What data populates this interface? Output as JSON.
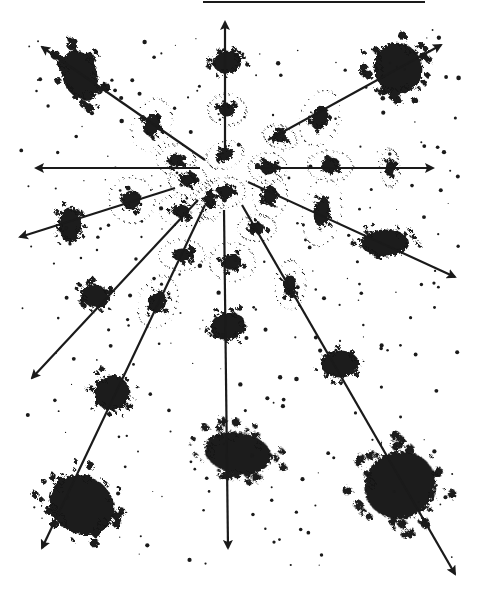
{
  "figure": {
    "ink_color": "#1a1a1a",
    "background_color": "#ffffff",
    "top_rule": {
      "x1": 203,
      "y1": 2,
      "x2": 425,
      "y2": 2
    },
    "center": {
      "x": 222,
      "y": 170
    },
    "arrows": [
      {
        "id": "up",
        "x1": 225,
        "y1": 150,
        "x2": 225,
        "y2": 22
      },
      {
        "id": "upper-left",
        "x1": 205,
        "y1": 160,
        "x2": 42,
        "y2": 47
      },
      {
        "id": "upper-right",
        "x1": 268,
        "y1": 140,
        "x2": 441,
        "y2": 45
      },
      {
        "id": "left",
        "x1": 200,
        "y1": 168,
        "x2": 36,
        "y2": 168
      },
      {
        "id": "right",
        "x1": 255,
        "y1": 168,
        "x2": 433,
        "y2": 168
      },
      {
        "id": "left-low",
        "x1": 175,
        "y1": 188,
        "x2": 20,
        "y2": 237
      },
      {
        "id": "right-low",
        "x1": 248,
        "y1": 182,
        "x2": 455,
        "y2": 277
      },
      {
        "id": "down-left",
        "x1": 198,
        "y1": 200,
        "x2": 32,
        "y2": 378
      },
      {
        "id": "down-left-2",
        "x1": 205,
        "y1": 205,
        "x2": 42,
        "y2": 548
      },
      {
        "id": "down",
        "x1": 224,
        "y1": 210,
        "x2": 228,
        "y2": 548
      },
      {
        "id": "down-right",
        "x1": 242,
        "y1": 205,
        "x2": 455,
        "y2": 574
      }
    ],
    "galaxies": [
      {
        "x": 80,
        "y": 75,
        "rx": 22,
        "ry": 32,
        "rot": -20,
        "size": "large"
      },
      {
        "x": 227,
        "y": 62,
        "rx": 18,
        "ry": 14,
        "rot": 0,
        "size": "medium"
      },
      {
        "x": 227,
        "y": 110,
        "rx": 10,
        "ry": 8,
        "rot": 0,
        "size": "small"
      },
      {
        "x": 152,
        "y": 125,
        "rx": 10,
        "ry": 14,
        "rot": 20,
        "size": "small"
      },
      {
        "x": 320,
        "y": 118,
        "rx": 10,
        "ry": 15,
        "rot": 20,
        "size": "small"
      },
      {
        "x": 280,
        "y": 137,
        "rx": 9,
        "ry": 6,
        "rot": 20,
        "size": "small"
      },
      {
        "x": 398,
        "y": 68,
        "rx": 30,
        "ry": 32,
        "rot": -30,
        "size": "large"
      },
      {
        "x": 176,
        "y": 160,
        "rx": 10,
        "ry": 8,
        "rot": 0,
        "size": "small"
      },
      {
        "x": 225,
        "y": 155,
        "rx": 10,
        "ry": 7,
        "rot": -20,
        "size": "small"
      },
      {
        "x": 268,
        "y": 168,
        "rx": 10,
        "ry": 8,
        "rot": 0,
        "size": "small"
      },
      {
        "x": 330,
        "y": 166,
        "rx": 12,
        "ry": 8,
        "rot": 0,
        "size": "small"
      },
      {
        "x": 390,
        "y": 168,
        "rx": 5,
        "ry": 10,
        "rot": 0,
        "size": "small"
      },
      {
        "x": 188,
        "y": 180,
        "rx": 10,
        "ry": 8,
        "rot": 0,
        "size": "small"
      },
      {
        "x": 132,
        "y": 200,
        "rx": 12,
        "ry": 12,
        "rot": 0,
        "size": "small"
      },
      {
        "x": 70,
        "y": 225,
        "rx": 14,
        "ry": 22,
        "rot": 0,
        "size": "medium"
      },
      {
        "x": 210,
        "y": 200,
        "rx": 7,
        "ry": 10,
        "rot": 0,
        "size": "small"
      },
      {
        "x": 226,
        "y": 192,
        "rx": 10,
        "ry": 8,
        "rot": 0,
        "size": "small"
      },
      {
        "x": 270,
        "y": 195,
        "rx": 9,
        "ry": 12,
        "rot": 0,
        "size": "small"
      },
      {
        "x": 181,
        "y": 211,
        "rx": 12,
        "ry": 8,
        "rot": 10,
        "size": "small"
      },
      {
        "x": 322,
        "y": 212,
        "rx": 10,
        "ry": 18,
        "rot": 10,
        "size": "small"
      },
      {
        "x": 257,
        "y": 228,
        "rx": 10,
        "ry": 7,
        "rot": 0,
        "size": "small"
      },
      {
        "x": 385,
        "y": 243,
        "rx": 30,
        "ry": 17,
        "rot": 0,
        "size": "medium"
      },
      {
        "x": 182,
        "y": 255,
        "rx": 12,
        "ry": 8,
        "rot": 0,
        "size": "small"
      },
      {
        "x": 232,
        "y": 262,
        "rx": 12,
        "ry": 10,
        "rot": 0,
        "size": "small"
      },
      {
        "x": 95,
        "y": 296,
        "rx": 18,
        "ry": 14,
        "rot": 20,
        "size": "medium"
      },
      {
        "x": 158,
        "y": 302,
        "rx": 10,
        "ry": 14,
        "rot": 20,
        "size": "small"
      },
      {
        "x": 290,
        "y": 285,
        "rx": 8,
        "ry": 13,
        "rot": 0,
        "size": "small"
      },
      {
        "x": 228,
        "y": 326,
        "rx": 22,
        "ry": 17,
        "rot": -10,
        "size": "medium"
      },
      {
        "x": 340,
        "y": 364,
        "rx": 24,
        "ry": 17,
        "rot": 0,
        "size": "medium"
      },
      {
        "x": 112,
        "y": 393,
        "rx": 22,
        "ry": 22,
        "rot": 30,
        "size": "medium"
      },
      {
        "x": 238,
        "y": 453,
        "rx": 42,
        "ry": 26,
        "rot": 10,
        "size": "large"
      },
      {
        "x": 82,
        "y": 505,
        "rx": 42,
        "ry": 36,
        "rot": 30,
        "size": "large"
      },
      {
        "x": 400,
        "y": 485,
        "rx": 45,
        "ry": 42,
        "rot": -20,
        "size": "large"
      }
    ]
  }
}
